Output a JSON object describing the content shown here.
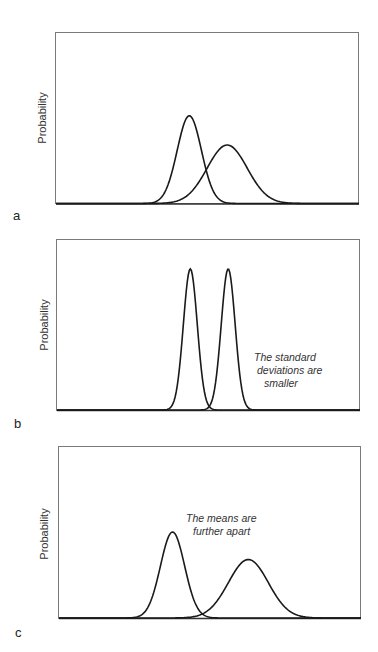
{
  "figure": {
    "panels": [
      {
        "id": "a",
        "label": "a",
        "ylabel": "Probability",
        "annotation": [],
        "curves": [
          {
            "name": "distribution 1",
            "mean": 0.44,
            "sd": 0.04,
            "peak": 0.51
          },
          {
            "name": "distribution 2",
            "mean": 0.565,
            "sd": 0.066,
            "peak": 0.34
          }
        ]
      },
      {
        "id": "b",
        "label": "b",
        "ylabel": "Probability",
        "annotation": [
          "The standard",
          "deviations are",
          "smaller"
        ],
        "curves": [
          {
            "name": "distribution 1",
            "mean": 0.44,
            "sd": 0.023,
            "peak": 0.82
          },
          {
            "name": "distribution 2",
            "mean": 0.565,
            "sd": 0.023,
            "peak": 0.82
          }
        ]
      },
      {
        "id": "c",
        "label": "c",
        "ylabel": "Probability",
        "annotation": [
          "The means are",
          "further apart"
        ],
        "curves": [
          {
            "name": "distribution 1",
            "mean": 0.376,
            "sd": 0.04,
            "peak": 0.5
          },
          {
            "name": "distribution 2",
            "mean": 0.627,
            "sd": 0.066,
            "peak": 0.34
          }
        ]
      }
    ]
  },
  "chart_data": [
    {
      "type": "line",
      "title": "",
      "panel_label": "a",
      "xlabel": "",
      "ylabel": "Probability",
      "grid": false,
      "x_range": [
        0,
        1
      ],
      "ylim": [
        0,
        1
      ],
      "series": [
        {
          "name": "distribution 1",
          "kind": "normal",
          "mean": 0.44,
          "sd": 0.04,
          "peak_height": 0.51
        },
        {
          "name": "distribution 2",
          "kind": "normal",
          "mean": 0.565,
          "sd": 0.066,
          "peak_height": 0.34
        }
      ],
      "annotations": []
    },
    {
      "type": "line",
      "title": "",
      "panel_label": "b",
      "xlabel": "",
      "ylabel": "Probability",
      "grid": false,
      "x_range": [
        0,
        1
      ],
      "ylim": [
        0,
        1
      ],
      "series": [
        {
          "name": "distribution 1",
          "kind": "normal",
          "mean": 0.44,
          "sd": 0.023,
          "peak_height": 0.82
        },
        {
          "name": "distribution 2",
          "kind": "normal",
          "mean": 0.565,
          "sd": 0.023,
          "peak_height": 0.82
        }
      ],
      "annotations": [
        "The standard deviations are smaller"
      ]
    },
    {
      "type": "line",
      "title": "",
      "panel_label": "c",
      "xlabel": "",
      "ylabel": "Probability",
      "grid": false,
      "x_range": [
        0,
        1
      ],
      "ylim": [
        0,
        1
      ],
      "series": [
        {
          "name": "distribution 1",
          "kind": "normal",
          "mean": 0.376,
          "sd": 0.04,
          "peak_height": 0.5
        },
        {
          "name": "distribution 2",
          "kind": "normal",
          "mean": 0.627,
          "sd": 0.066,
          "peak_height": 0.34
        }
      ],
      "annotations": [
        "The means are further apart"
      ]
    }
  ]
}
